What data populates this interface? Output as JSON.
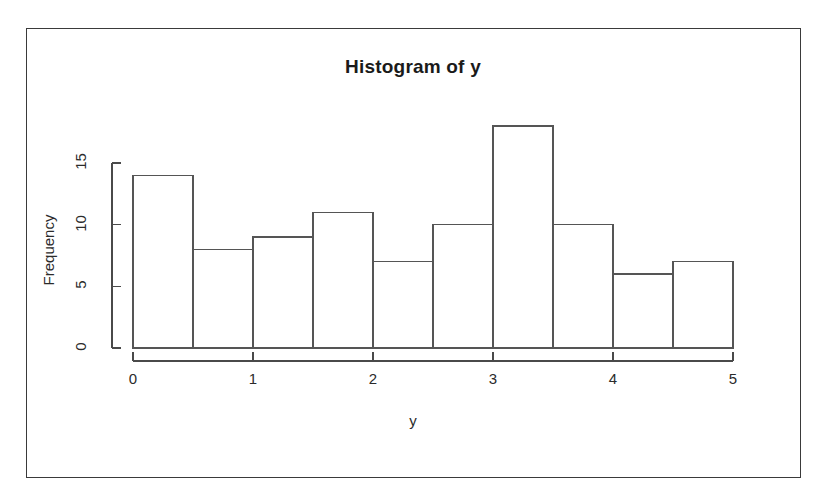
{
  "figure": {
    "title": "Histogram of y",
    "xlabel": "y",
    "ylabel": "Frequency",
    "frame_color": "#3a3a3a",
    "axis_color": "#4a4a4a",
    "bar_border_color": "#555555",
    "bar_fill_color": "#ffffff",
    "background": "#ffffff"
  },
  "axes": {
    "y_ticks": [
      "0",
      "5",
      "10",
      "15"
    ],
    "x_ticks": [
      "0",
      "1",
      "2",
      "3",
      "4",
      "5"
    ]
  },
  "chart_data": {
    "type": "bar",
    "title": "Histogram of y",
    "xlabel": "y",
    "ylabel": "Frequency",
    "bin_width": 0.5,
    "bin_edges": [
      0,
      0.5,
      1.0,
      1.5,
      2.0,
      2.5,
      3.0,
      3.5,
      4.0,
      4.5,
      5.0
    ],
    "categories": [
      "0-0.5",
      "0.5-1",
      "1-1.5",
      "1.5-2",
      "2-2.5",
      "2.5-3",
      "3-3.5",
      "3.5-4",
      "4-4.5",
      "4.5-5"
    ],
    "values": [
      14,
      8,
      9,
      11,
      7,
      10,
      18,
      10,
      6,
      7
    ],
    "xlim": [
      0,
      5
    ],
    "ylim": [
      0,
      18
    ],
    "y_tick_values": [
      0,
      5,
      10,
      15
    ],
    "x_tick_values": [
      0,
      1,
      2,
      3,
      4,
      5
    ],
    "grid": false,
    "legend": false
  }
}
